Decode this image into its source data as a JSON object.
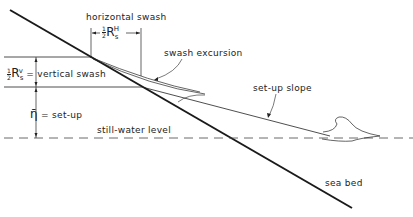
{
  "diagram": {
    "labels": {
      "horizontal_swash": "horizontal swash",
      "horizontal_swash_symbol": "R",
      "horizontal_swash_sup": "H",
      "horizontal_swash_sub": "s",
      "frac_num": "1",
      "frac_den": "2",
      "swash_excursion": "swash excursion",
      "vertical_swash_symbol": "R",
      "vertical_swash_sup": "v",
      "vertical_swash_sub": "s",
      "vertical_swash": "= vertical swash",
      "setup_symbol": "η̄",
      "setup": "= set-up",
      "still_water_level": "still-water level",
      "setup_slope": "set-up slope",
      "sea_bed": "sea bed"
    },
    "colors": {
      "line": "#222222",
      "seabed": "#1a1a1a",
      "dashed": "#444444"
    }
  }
}
